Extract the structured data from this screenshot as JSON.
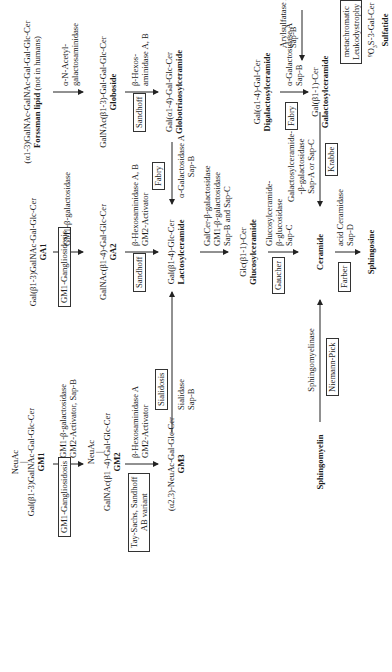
{
  "diagram": {
    "nodes": {
      "forssman": {
        "formula": "(α1-3)GalNAc-GalNAc-Gal-Gal-Glc-Cer",
        "name_bold": "Forssman lipid",
        "name_suffix": " (not in humans)"
      },
      "globoside": {
        "formula": "GalNAc(β1-3)-Gal-Gal-Glc-Cer",
        "name": "Globoside"
      },
      "globotriaosylceramide": {
        "formula": "Gal(α1-4)-Gal-Glc-Cer",
        "name": "Globotriaosylceramide"
      },
      "digalactosylceramide": {
        "formula": "Gal(α1-4)-Gal-Cer",
        "name": "Digalactosylceramide"
      },
      "galactosylceramide": {
        "formula": "Gal(β1-1)-Cer",
        "name": "Galactosylceramide"
      },
      "sulfatide": {
        "formula_prefix": "⁹O",
        "formula_sub": "3",
        "formula_rest": "S-3-Gal-Cer",
        "name": "Sulfatide"
      },
      "ga1": {
        "formula": "Gal(β1-3)GalNAc-Gal-Glc-Cer",
        "name": "GA1"
      },
      "ga2": {
        "formula": "GalNAc(β1-4)-Gal-Glc-Cer",
        "name": "GA2"
      },
      "gm1": {
        "branch": "NeuAc",
        "branch_bar": "|",
        "formula": "Gal(β1-3)GalNAc-Gal-Glc-Cer",
        "name": "GM1"
      },
      "gm2": {
        "branch": "NeuAc",
        "branch_bar": "|",
        "formula": "GalNAc(β1 -4)-Gal-Glc-Cer",
        "name": "GM2"
      },
      "gm3": {
        "formula": "(α2,3)-NeuAc-Gal-Glc-Cer",
        "name": "GM3"
      },
      "lactosylceramide": {
        "formula": "Gal(β1-4)-Glc-Cer",
        "name": "Lactosylceramide"
      },
      "glucosylceramide": {
        "formula": "Glc(β1-1)-Cer",
        "name": "Glucosylceramide"
      },
      "ceramide": {
        "name": "Ceramide"
      },
      "sphingosine": {
        "name": "Sphingosine"
      },
      "sphingomyelin": {
        "name": "Sphingomyelin"
      }
    },
    "enzymes": {
      "forssman_to_globoside": [
        "α-N-Acetyl-",
        "galactosaminidase"
      ],
      "globoside_to_globotriaosyl": [
        "β-Hexos-",
        "aminidase A, B"
      ],
      "ga1_to_ga2": [
        "GM1-β-galactosidase"
      ],
      "gm1_to_gm2": [
        "GM1-β-galactosidase",
        "GM2-Activator, Sap-B"
      ],
      "gm2_to_gm3": [
        "β-Hexosaminidase A",
        "GM2-Activator"
      ],
      "ga2_to_lactosyl": [
        "β-Hexosaminidase A, B",
        "GM2-Activator"
      ],
      "gm3_to_lactosyl": [
        "Sialidase",
        "Sap-B"
      ],
      "globotriaosyl_to_lactosyl": [
        "α-Galactosidase A",
        "Sap-B"
      ],
      "lactosyl_to_glucosyl": [
        "GalCer-β-galactosidase",
        "GM1-β-galactosidase",
        "Sap-B and Sap-C"
      ],
      "digalactosyl_to_galactosyl": [
        "α-Galactosidase A",
        "Sap-B"
      ],
      "sulfatide_to_galactosyl": [
        "Arylsulfatase A",
        "Sap-B"
      ],
      "glucosyl_to_ceramide": [
        "Glucosylceramide-",
        "β-glucosidase",
        "Sap-C"
      ],
      "galactosyl_to_ceramide": [
        "Galactosylceramide-",
        "-β-galactosidase",
        "Sap-A or Sap-C"
      ],
      "sphingomyelin_to_ceramide": [
        "Sphingomyelinase"
      ],
      "ceramide_to_sphingosine": [
        "acid Ceramidase",
        "Sap-D"
      ]
    },
    "diseases": {
      "gm1_gangliosidosis_a": "GM1-Gangliosidosis",
      "gm1_gangliosidosis_b": "GM1-Gangliosidosis",
      "sandhoff_a": "Sandhoff",
      "sandhoff_b": "Sandhoff",
      "tay_sachs": [
        "Tay-Sachs, Sandhoff",
        "AB variant"
      ],
      "sialidosis": "Sialidosis",
      "fabry_a": "Fabry",
      "fabry_b": "Fabry",
      "metachromatic": [
        "metachromatic",
        "Leukodystrophy"
      ],
      "krabbe": "Krabbe",
      "gaucher": "Gaucher",
      "niemann_pick": "Niemann-Pick",
      "farber": "Farber"
    }
  }
}
